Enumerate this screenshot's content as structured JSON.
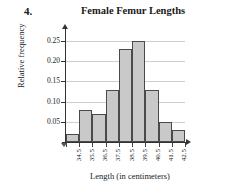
{
  "problem": {
    "number": "4."
  },
  "chart_data": {
    "type": "bar",
    "title": "Female Femur Lengths",
    "xlabel": "Length (in centimeters)",
    "ylabel": "Relative frequency",
    "categories": [
      "34.5",
      "35.5",
      "36.5",
      "37.5",
      "38.5",
      "39.5",
      "40.5",
      "41.5",
      "42.5"
    ],
    "values": [
      0.02,
      0.08,
      0.07,
      0.13,
      0.23,
      0.25,
      0.13,
      0.05,
      0.03
    ],
    "ylim": [
      0,
      0.27
    ],
    "ytick_labels": [
      "0.05",
      "0.10",
      "0.15",
      "0.20",
      "0.25"
    ],
    "ytick_values": [
      0.05,
      0.1,
      0.15,
      0.2,
      0.25
    ],
    "grid": true,
    "legend": "none",
    "bar_fill": "#c9c9c9",
    "bar_stroke": "#4a4a4a",
    "gridline_color": "#cfcfcf",
    "axis_color": "#333333"
  }
}
